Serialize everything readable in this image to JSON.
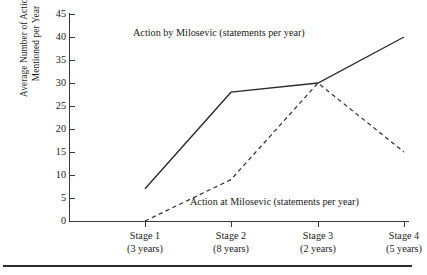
{
  "chart_data": {
    "type": "line",
    "title": "",
    "xlabel": "",
    "ylabel": "Average Number of Actions\nMentioned per Year",
    "categories": [
      "Stage 1",
      "Stage 2",
      "Stage 3",
      "Stage 4"
    ],
    "category_sublabels": [
      "(3 years)",
      "(8 years)",
      "(2 years)",
      "(5 years)"
    ],
    "ylim": [
      0,
      45
    ],
    "yticks": [
      0,
      5,
      10,
      15,
      20,
      25,
      30,
      35,
      40,
      45
    ],
    "ytick_labels": [
      "0",
      "5",
      "10",
      "15",
      "20",
      "25",
      "30",
      "35",
      "40",
      "45"
    ],
    "grid": false,
    "legend_position": "inline-annotation",
    "series": [
      {
        "name": "Action by Milosevic (statements per year)",
        "style": "solid",
        "color": "#2b2b2b",
        "values": [
          7,
          28,
          30,
          40
        ]
      },
      {
        "name": "Action at Milosevic (statements per year)",
        "style": "dashed",
        "color": "#2b2b2b",
        "values": [
          0,
          9,
          30,
          15
        ]
      }
    ],
    "annotations": [
      {
        "text": "Action by Milosevic (statements per year)",
        "series": "solid"
      },
      {
        "text": "Action at Milosevic (statements per year)",
        "series": "dashed"
      }
    ]
  },
  "axis": {
    "y_title_line1": "Average Number of Actions",
    "y_title_line2": "Mentioned per Year"
  }
}
